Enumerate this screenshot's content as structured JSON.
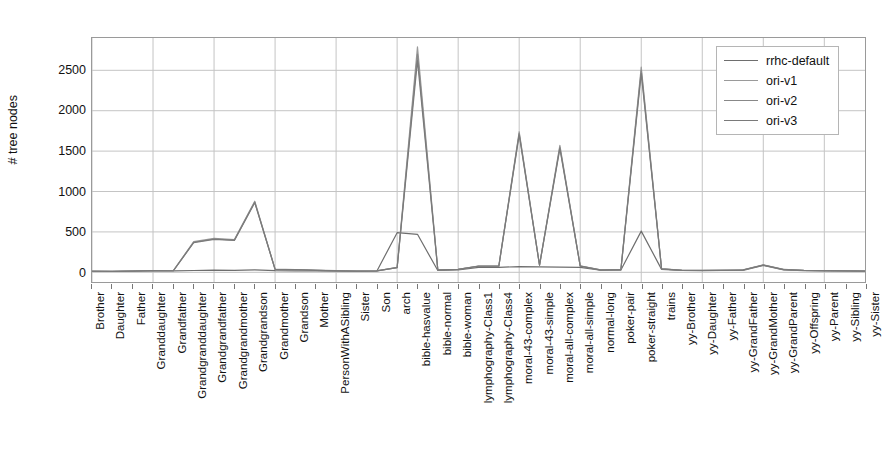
{
  "chart_data": {
    "type": "line",
    "title": "",
    "xlabel": "",
    "ylabel": "# tree nodes",
    "ylim": [
      -120,
      2900
    ],
    "yticks": [
      0,
      500,
      1000,
      1500,
      2000,
      2500
    ],
    "grid": true,
    "legend_position": "upper right",
    "categories": [
      "Brother",
      "Daughter",
      "Father",
      "Granddaughter",
      "Grandfather",
      "Grandgranddaughter",
      "Grandgrandfather",
      "Grandgrandmother",
      "Grandgrandson",
      "Grandmother",
      "Grandson",
      "Mother",
      "PersonWithASibling",
      "Sister",
      "Son",
      "arch",
      "bible-hasvalue",
      "bible-normal",
      "bible-woman",
      "lymphography-Class1",
      "lymphography-Class4",
      "moral-43-complex",
      "moral-43-simple",
      "moral-all-complex",
      "moral-all-simple",
      "normal-long",
      "poker-pair",
      "poker-straight",
      "trains",
      "yy-Brother",
      "yy-Daughter",
      "yy-Father",
      "yy-GrandFather",
      "yy-GrandMother",
      "yy-GrandParent",
      "yy-Offspring",
      "yy-Parent",
      "yy-Sibling",
      "yy-Sister"
    ],
    "series": [
      {
        "name": "rrhc-default",
        "color": "#6e6e6e",
        "values": [
          12,
          10,
          14,
          20,
          18,
          22,
          26,
          24,
          30,
          20,
          18,
          16,
          14,
          12,
          14,
          490,
          470,
          22,
          30,
          60,
          62,
          70,
          66,
          64,
          60,
          26,
          28,
          510,
          36,
          22,
          20,
          22,
          24,
          85,
          30,
          20,
          18,
          16,
          14
        ]
      },
      {
        "name": "ori-v1",
        "color": "#9a9a9a",
        "values": [
          14,
          12,
          16,
          22,
          20,
          380,
          420,
          405,
          880,
          40,
          34,
          26,
          20,
          16,
          18,
          60,
          2790,
          30,
          38,
          78,
          80,
          1740,
          90,
          1570,
          80,
          30,
          34,
          2540,
          44,
          26,
          24,
          26,
          30,
          92,
          36,
          24,
          22,
          18,
          16
        ]
      },
      {
        "name": "ori-v2",
        "color": "#888888",
        "values": [
          13,
          11,
          15,
          21,
          19,
          372,
          412,
          398,
          870,
          38,
          33,
          25,
          19,
          15,
          17,
          58,
          2700,
          29,
          37,
          76,
          78,
          1720,
          88,
          1550,
          78,
          29,
          33,
          2500,
          43,
          25,
          23,
          25,
          29,
          90,
          35,
          23,
          21,
          17,
          15
        ]
      },
      {
        "name": "ori-v3",
        "color": "#7a7a7a",
        "values": [
          13,
          11,
          15,
          21,
          19,
          368,
          408,
          394,
          862,
          37,
          32,
          24,
          19,
          15,
          17,
          57,
          2620,
          28,
          36,
          75,
          77,
          1700,
          87,
          1530,
          77,
          28,
          32,
          2460,
          42,
          24,
          22,
          24,
          28,
          88,
          34,
          22,
          20,
          17,
          15
        ]
      }
    ]
  },
  "legend": {
    "items": [
      {
        "label": "rrhc-default",
        "color": "#6e6e6e"
      },
      {
        "label": "ori-v1",
        "color": "#9a9a9a"
      },
      {
        "label": "ori-v2",
        "color": "#888888"
      },
      {
        "label": "ori-v3",
        "color": "#7a7a7a"
      }
    ]
  },
  "axes": {
    "y_title": "# tree nodes",
    "y_tick_labels": [
      "0",
      "500",
      "1000",
      "1500",
      "2000",
      "2500"
    ]
  }
}
